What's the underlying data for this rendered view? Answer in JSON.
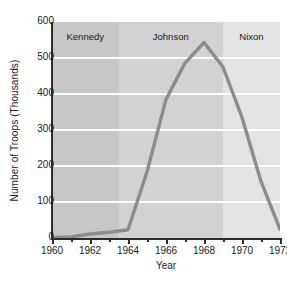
{
  "chart_data": {
    "type": "line",
    "title": "",
    "xlabel": "Year",
    "ylabel": "Number of Troops (Thousands)",
    "xlim": [
      1960,
      1972
    ],
    "ylim": [
      0,
      600
    ],
    "grid": true,
    "legend": "none",
    "x_ticks_major": [
      1960,
      1962,
      1964,
      1966,
      1968,
      1970,
      1972
    ],
    "x_ticks_minor": [
      1961,
      1963,
      1965,
      1967,
      1969,
      1971
    ],
    "y_ticks": [
      0,
      100,
      200,
      300,
      400,
      500,
      600
    ],
    "x_tick_labels": [
      "1960",
      "1962",
      "1964",
      "1966",
      "1968",
      "1970",
      "1972"
    ],
    "y_tick_labels": [
      "0",
      "100",
      "200",
      "300",
      "400",
      "500",
      "600"
    ],
    "series": [
      {
        "name": "U.S. Troops in Vietnam",
        "color": "#8c8c8c",
        "x": [
          1960,
          1961,
          1962,
          1963,
          1964,
          1965,
          1966,
          1967,
          1968,
          1969,
          1970,
          1971,
          1972
        ],
        "values": [
          1,
          3,
          11,
          16,
          23,
          184,
          385,
          486,
          543,
          475,
          335,
          157,
          24
        ]
      }
    ],
    "bands": [
      {
        "label": "Kennedy",
        "x_start": 1960,
        "x_end": 1963.5,
        "color": "#c7c7c7"
      },
      {
        "label": "Johnson",
        "x_start": 1963.5,
        "x_end": 1969.0,
        "color": "#d2d2d2"
      },
      {
        "label": "Nixon",
        "x_start": 1969.0,
        "x_end": 1972,
        "color": "#e3e3e3"
      }
    ]
  }
}
